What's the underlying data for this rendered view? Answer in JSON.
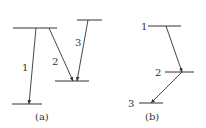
{
  "diagram": {
    "type": "energy-level-transitions",
    "panels": [
      {
        "id": "a",
        "caption": "(a)",
        "levels": [
          {
            "name": "upper-left",
            "x1": 13,
            "x2": 57,
            "y": 28
          },
          {
            "name": "upper-right",
            "x1": 77,
            "x2": 102,
            "y": 20
          },
          {
            "name": "middle",
            "x1": 55,
            "x2": 89,
            "y": 81
          },
          {
            "name": "bottom",
            "x1": 12,
            "x2": 42,
            "y": 104
          }
        ],
        "transitions": [
          {
            "label": "1",
            "from": [
              36,
              28
            ],
            "to": [
              29,
              104
            ],
            "label_pos": [
              25,
              68
            ]
          },
          {
            "label": "2",
            "from": [
              49,
              28
            ],
            "to": [
              73,
              81
            ],
            "label_pos": [
              55,
              62
            ]
          },
          {
            "label": "3",
            "from": [
              88,
              20
            ],
            "to": [
              77,
              81
            ],
            "label_pos": [
              77,
              43
            ]
          }
        ]
      },
      {
        "id": "b",
        "caption": "(b)",
        "levels": [
          {
            "name": "level-1",
            "label": "1",
            "x1": 148,
            "x2": 181,
            "y": 26,
            "label_pos": [
              143,
              30
            ]
          },
          {
            "name": "level-2",
            "label": "2",
            "x1": 165,
            "x2": 194,
            "y": 72,
            "label_pos": [
              156,
              75
            ]
          },
          {
            "name": "level-3",
            "label": "3",
            "x1": 139,
            "x2": 163,
            "y": 103,
            "label_pos": [
              130,
              106
            ]
          }
        ],
        "transitions": [
          {
            "from": [
              166,
              26
            ],
            "to": [
              182,
              72
            ]
          },
          {
            "from": [
              182,
              72
            ],
            "to": [
              151,
              103
            ]
          }
        ]
      }
    ]
  },
  "labels": {
    "a_caption": "(a)",
    "b_caption": "(b)",
    "a_t1": "1",
    "a_t2": "2",
    "a_t3": "3",
    "b_l1": "1",
    "b_l2": "2",
    "b_l3": "3"
  }
}
